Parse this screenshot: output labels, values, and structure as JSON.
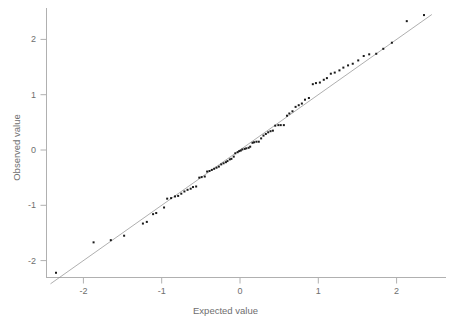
{
  "chart_data": {
    "type": "scatter",
    "title": "",
    "subtitle": "",
    "xlabel": "Expected value",
    "ylabel": "Observed value",
    "xlim": [
      -2.55,
      2.6
    ],
    "ylim": [
      -2.45,
      2.52
    ],
    "xticks": [
      -2,
      -1,
      0,
      1,
      2
    ],
    "xticklabels": [
      "-2",
      "-1",
      "0",
      "1",
      "2"
    ],
    "yticks": [
      -2,
      -1,
      0,
      1,
      2
    ],
    "yticklabels": [
      "-2",
      "-1",
      "0",
      "1",
      "2"
    ],
    "grid": false,
    "legend": null,
    "annotations": [],
    "series": [
      {
        "name": "Q-Q points",
        "type": "scatter",
        "marker": "square",
        "marker_size": 2,
        "color": "#1a1a1a",
        "x": [
          -2.35,
          -1.87,
          -1.65,
          -1.48,
          -1.24,
          -1.19,
          -1.11,
          -1.07,
          -0.97,
          -0.93,
          -0.88,
          -0.83,
          -0.79,
          -0.75,
          -0.71,
          -0.67,
          -0.63,
          -0.6,
          -0.56,
          -0.52,
          -0.49,
          -0.45,
          -0.42,
          -0.39,
          -0.36,
          -0.33,
          -0.3,
          -0.27,
          -0.24,
          -0.21,
          -0.18,
          -0.16,
          -0.13,
          -0.11,
          -0.08,
          -0.06,
          -0.03,
          -0.01,
          0.01,
          0.03,
          0.06,
          0.08,
          0.11,
          0.13,
          0.16,
          0.18,
          0.21,
          0.24,
          0.27,
          0.3,
          0.33,
          0.36,
          0.39,
          0.42,
          0.45,
          0.49,
          0.52,
          0.56,
          0.6,
          0.63,
          0.67,
          0.71,
          0.75,
          0.79,
          0.83,
          0.88,
          0.93,
          0.97,
          1.02,
          1.07,
          1.11,
          1.16,
          1.21,
          1.27,
          1.32,
          1.38,
          1.44,
          1.51,
          1.58,
          1.65,
          1.74,
          1.83,
          1.94,
          2.13,
          2.35
        ],
        "y": [
          -2.22,
          -1.67,
          -1.63,
          -1.55,
          -1.33,
          -1.3,
          -1.16,
          -1.14,
          -1.04,
          -0.88,
          -0.87,
          -0.84,
          -0.83,
          -0.79,
          -0.75,
          -0.72,
          -0.7,
          -0.67,
          -0.66,
          -0.5,
          -0.49,
          -0.48,
          -0.39,
          -0.38,
          -0.36,
          -0.34,
          -0.32,
          -0.3,
          -0.26,
          -0.24,
          -0.22,
          -0.2,
          -0.17,
          -0.16,
          -0.12,
          -0.06,
          -0.04,
          -0.02,
          -0.01,
          0.01,
          0.02,
          0.03,
          0.04,
          0.06,
          0.13,
          0.14,
          0.15,
          0.15,
          0.21,
          0.26,
          0.29,
          0.32,
          0.34,
          0.35,
          0.44,
          0.45,
          0.45,
          0.45,
          0.62,
          0.66,
          0.7,
          0.78,
          0.81,
          0.84,
          0.91,
          0.94,
          1.19,
          1.21,
          1.22,
          1.27,
          1.3,
          1.38,
          1.4,
          1.44,
          1.49,
          1.53,
          1.56,
          1.62,
          1.7,
          1.73,
          1.74,
          1.83,
          1.94,
          2.33,
          2.44
        ]
      },
      {
        "name": "reference line",
        "type": "line",
        "color": "#8c8c8c",
        "width": 0.7,
        "x": [
          -2.42,
          2.45
        ],
        "y": [
          -2.42,
          2.45
        ]
      }
    ]
  },
  "axes": {
    "x_title": "Expected value",
    "y_title": "Observed value",
    "axis_color": "#b0b0b0",
    "tick_color": "#b0b0b0",
    "label_color": "#6e6e6e",
    "point_color": "#1a1a1a",
    "line_color": "#8c8c8c",
    "background": "#ffffff"
  }
}
